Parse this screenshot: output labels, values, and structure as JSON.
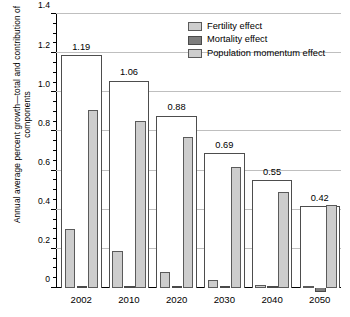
{
  "chart_data": {
    "type": "bar",
    "title": "",
    "xlabel": "",
    "ylabel": "Annual average percent growth—total and contribution of components",
    "ylim": [
      0,
      1.4
    ],
    "ytick_step": 0.2,
    "yminor_step": 0.05,
    "grid": true,
    "legend_position": "top-right",
    "categories": [
      "2002",
      "2010",
      "2020",
      "2030",
      "2040",
      "2050"
    ],
    "ytick_labels": [
      "0",
      "0.2",
      "0.4",
      "0.6",
      "0.8",
      "1.0",
      "1.2",
      "1.4"
    ],
    "total": {
      "name": "Total",
      "values": [
        1.19,
        1.06,
        0.88,
        0.69,
        0.55,
        0.42
      ],
      "labels": [
        "1.19",
        "1.06",
        "0.88",
        "0.69",
        "0.55",
        "0.42"
      ]
    },
    "series": [
      {
        "name": "Fertility effect",
        "key": "fert",
        "color": "#cdcdcd",
        "values": [
          0.3,
          0.19,
          0.08,
          0.04,
          0.015,
          0.005
        ]
      },
      {
        "name": "Mortality effect",
        "key": "mort",
        "color": "#7d7d7d",
        "values": [
          0.012,
          0.01,
          0.008,
          0.008,
          0.006,
          -0.02
        ]
      },
      {
        "name": "Population momentum effect",
        "key": "mom",
        "color": "#cdcdcd",
        "values": [
          0.91,
          0.855,
          0.77,
          0.62,
          0.49,
          0.425
        ]
      }
    ]
  },
  "legend": {
    "items": [
      {
        "label": "Fertility effect"
      },
      {
        "label": "Mortality effect"
      },
      {
        "label": "Population momentum effect"
      }
    ]
  }
}
